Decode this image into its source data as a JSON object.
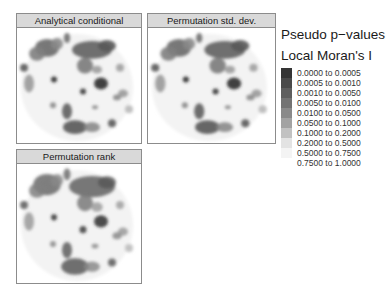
{
  "panels": [
    {
      "title": "Analytical conditional",
      "left": 16,
      "top": 13,
      "width": 126,
      "height": 131
    },
    {
      "title": "Permutation std. dev.",
      "left": 147,
      "top": 13,
      "width": 129,
      "height": 131
    },
    {
      "title": "Permutation rank",
      "left": 16,
      "top": 149,
      "width": 126,
      "height": 135
    }
  ],
  "legend": {
    "title": "Pseudo p−values",
    "subtitle": "Local Moran's I",
    "items": [
      {
        "label": "0.0000 to 0.0005",
        "color": "#353535"
      },
      {
        "label": "0.0005 to 0.0010",
        "color": "#4a4a4a"
      },
      {
        "label": "0.0010 to 0.0050",
        "color": "#5e5e5e"
      },
      {
        "label": "0.0050 to 0.0100",
        "color": "#737373"
      },
      {
        "label": "0.0100 to 0.0500",
        "color": "#8a8a8a"
      },
      {
        "label": "0.0500 to 0.1000",
        "color": "#a3a3a3"
      },
      {
        "label": "0.1000 to 0.2000",
        "color": "#c2c2c2"
      },
      {
        "label": "0.2000 to 0.5000",
        "color": "#e3e3e3"
      },
      {
        "label": "0.5000 to 0.7500",
        "color": "#f4f4f4"
      },
      {
        "label": "0.7500 to 1.0000",
        "color": "#ffffff"
      }
    ]
  },
  "map_blobs": [
    {
      "cx": 30,
      "cy": 20,
      "rx": 12,
      "ry": 9,
      "c": "#6a6a6a"
    },
    {
      "cx": 20,
      "cy": 26,
      "rx": 8,
      "ry": 7,
      "c": "#808080"
    },
    {
      "cx": 40,
      "cy": 16,
      "rx": 6,
      "ry": 6,
      "c": "#8a8a8a"
    },
    {
      "cx": 50,
      "cy": 10,
      "rx": 3,
      "ry": 5,
      "c": "#6f6f6f"
    },
    {
      "cx": 7,
      "cy": 40,
      "rx": 4,
      "ry": 4,
      "c": "#5a5a5a"
    },
    {
      "cx": 12,
      "cy": 56,
      "rx": 5,
      "ry": 9,
      "c": "#9a9a9a"
    },
    {
      "cx": 75,
      "cy": 22,
      "rx": 20,
      "ry": 9,
      "c": "#606060"
    },
    {
      "cx": 90,
      "cy": 18,
      "rx": 9,
      "ry": 6,
      "c": "#585858"
    },
    {
      "cx": 68,
      "cy": 38,
      "rx": 8,
      "ry": 8,
      "c": "#7a7a7a"
    },
    {
      "cx": 80,
      "cy": 42,
      "rx": 5,
      "ry": 4,
      "c": "#9c9c9c"
    },
    {
      "cx": 37,
      "cy": 52,
      "rx": 3,
      "ry": 3,
      "c": "#2f2f2f"
    },
    {
      "cx": 84,
      "cy": 56,
      "rx": 7,
      "ry": 6,
      "c": "#2e2e2e"
    },
    {
      "cx": 66,
      "cy": 64,
      "rx": 3,
      "ry": 3,
      "c": "#383838"
    },
    {
      "cx": 103,
      "cy": 40,
      "rx": 4,
      "ry": 4,
      "c": "#a0a0a0"
    },
    {
      "cx": 106,
      "cy": 66,
      "rx": 5,
      "ry": 4,
      "c": "#9a9a9a"
    },
    {
      "cx": 100,
      "cy": 70,
      "rx": 4,
      "ry": 3,
      "c": "#8a8a8a"
    },
    {
      "cx": 36,
      "cy": 78,
      "rx": 3,
      "ry": 3,
      "c": "#8a8a8a"
    },
    {
      "cx": 50,
      "cy": 84,
      "rx": 5,
      "ry": 8,
      "c": "#5e5e5e"
    },
    {
      "cx": 58,
      "cy": 100,
      "rx": 12,
      "ry": 7,
      "c": "#585858"
    },
    {
      "cx": 75,
      "cy": 100,
      "rx": 8,
      "ry": 5,
      "c": "#8a8a8a"
    },
    {
      "cx": 95,
      "cy": 96,
      "rx": 4,
      "ry": 4,
      "c": "#5a5a5a"
    },
    {
      "cx": 78,
      "cy": 80,
      "rx": 3,
      "ry": 2,
      "c": "#8a8a8a"
    },
    {
      "cx": 112,
      "cy": 82,
      "rx": 4,
      "ry": 4,
      "c": "#b8b8b8"
    }
  ]
}
